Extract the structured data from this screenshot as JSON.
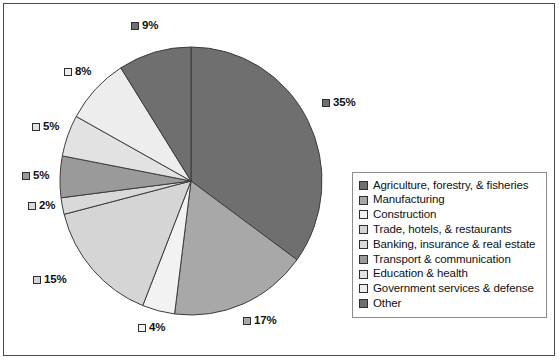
{
  "chart_data": {
    "type": "pie",
    "title": "",
    "subtitle": "",
    "xlabel": "",
    "ylabel": "",
    "grid": false,
    "legend_position": "right",
    "start_angle_deg": 0,
    "direction": "clockwise",
    "categories": [
      "Agriculture, forestry, & fisheries",
      "Manufacturing",
      "Construction",
      "Trade, hotels, & restaurants",
      "Banking, insurance & real estate",
      "Transport & communication",
      "Education & health",
      "Government services & defense",
      "Other"
    ],
    "values": [
      35,
      17,
      4,
      15,
      2,
      5,
      5,
      8,
      9
    ],
    "value_labels": [
      "35%",
      "17%",
      "4%",
      "15%",
      "2%",
      "5%",
      "5%",
      "8%",
      "9%"
    ],
    "colors": [
      "#6f6f6f",
      "#a8a8a8",
      "#f2f2f2",
      "#d5d5d5",
      "#d9d9d9",
      "#9a9a9a",
      "#e2e2e2",
      "#ededed",
      "#6f6f6f"
    ],
    "slice_border_color": "#3d3d3d",
    "frame_border_color": "#4a4a4a",
    "legend_border_color": "#8c8c8c",
    "background": "#ffffff"
  },
  "legend": {
    "items": [
      {
        "label": "Agriculture, forestry, & fisheries",
        "color": "#6f6f6f"
      },
      {
        "label": "Manufacturing",
        "color": "#a8a8a8"
      },
      {
        "label": "Construction",
        "color": "#f2f2f2"
      },
      {
        "label": "Trade, hotels, & restaurants",
        "color": "#d5d5d5"
      },
      {
        "label": "Banking, insurance & real estate",
        "color": "#d9d9d9"
      },
      {
        "label": "Transport & communication",
        "color": "#9a9a9a"
      },
      {
        "label": "Education & health",
        "color": "#e2e2e2"
      },
      {
        "label": "Government services & defense",
        "color": "#ededed"
      },
      {
        "label": "Other",
        "color": "#6f6f6f"
      }
    ]
  },
  "labels": [
    {
      "text": "9%",
      "color": "#6f6f6f",
      "left": 131,
      "top": 20
    },
    {
      "text": "35%",
      "color": "#6f6f6f",
      "left": 322,
      "top": 97
    },
    {
      "text": "17%",
      "color": "#a8a8a8",
      "left": 243,
      "top": 315
    },
    {
      "text": "4%",
      "color": "#f2f2f2",
      "left": 138,
      "top": 322
    },
    {
      "text": "15%",
      "color": "#d5d5d5",
      "left": 33,
      "top": 274
    },
    {
      "text": "2%",
      "color": "#d9d9d9",
      "left": 28,
      "top": 200
    },
    {
      "text": "5%",
      "color": "#9a9a9a",
      "left": 22,
      "top": 170
    },
    {
      "text": "5%",
      "color": "#e2e2e2",
      "left": 32,
      "top": 121
    },
    {
      "text": "8%",
      "color": "#ededed",
      "left": 64,
      "top": 66
    }
  ]
}
